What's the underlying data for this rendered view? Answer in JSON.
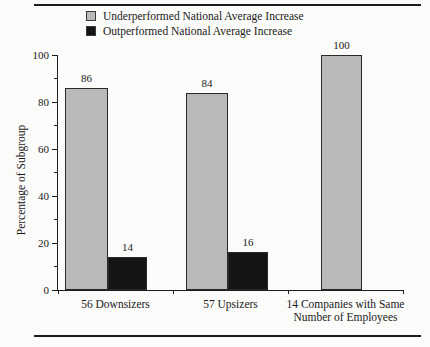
{
  "chart_data": {
    "type": "bar",
    "title": "",
    "xlabel": "",
    "ylabel": "Percentage of Subgroup",
    "ylim": [
      0,
      100
    ],
    "y_ticks": [
      0,
      20,
      40,
      60,
      80,
      100
    ],
    "minor_tick_values": [
      10,
      30,
      50,
      70,
      90
    ],
    "grid": false,
    "legend_position": "top",
    "categories": [
      "56 Downsizers",
      "57 Upsizers",
      "14 Companies with Same Number of Employees"
    ],
    "series": [
      {
        "name": "Underperformed National Average Increase",
        "color": "#b9b9b9",
        "values": [
          86,
          84,
          100
        ]
      },
      {
        "name": "Outperformed National Average Increase",
        "color": "#141414",
        "values": [
          14,
          16,
          null
        ]
      }
    ],
    "bar_value_labels": [
      {
        "category": "56 Downsizers",
        "underperformed": "86",
        "outperformed": "14"
      },
      {
        "category": "57 Upsizers",
        "underperformed": "84",
        "outperformed": "16"
      },
      {
        "category": "14 Companies with Same Number of Employees",
        "underperformed": "100",
        "outperformed": null
      }
    ]
  },
  "colors": {
    "underperformed_fill": "#b9b9b9",
    "outperformed_fill": "#141414",
    "axis": "#1c1c1c",
    "text": "#1a1a1a"
  }
}
